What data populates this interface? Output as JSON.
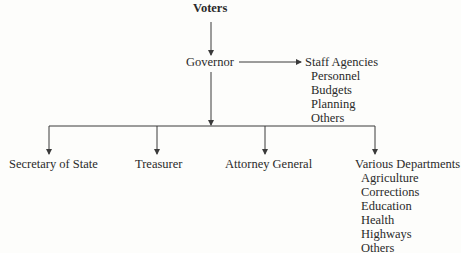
{
  "diagram": {
    "top": {
      "label": "Voters"
    },
    "executive": {
      "label": "Governor"
    },
    "staff": {
      "label": "Staff Agencies",
      "items": [
        "Personnel",
        "Budgets",
        "Planning",
        "Others"
      ]
    },
    "offices": [
      {
        "label": "Secretary of State"
      },
      {
        "label": "Treasurer"
      },
      {
        "label": "Attorney General"
      },
      {
        "label": "Various Departments",
        "items": [
          "Agriculture",
          "Corrections",
          "Education",
          "Health",
          "Highways",
          "Others"
        ]
      }
    ],
    "colors": {
      "line": "#3a3a3a",
      "text": "#2a2a2a",
      "background": "#fdfdfb"
    }
  }
}
